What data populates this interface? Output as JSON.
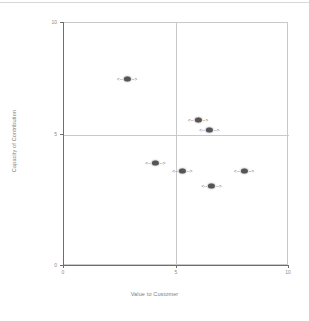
{
  "chart_data": {
    "type": "scatter",
    "title": "",
    "xlabel": "Value to Customer",
    "ylabel": "Capacity of Contribution",
    "xlim": [
      0,
      10
    ],
    "ylim": [
      0,
      10
    ],
    "xticks": [
      "0",
      "5",
      "10"
    ],
    "ytick_values": [
      0,
      5,
      10
    ],
    "yticks": [
      "0",
      "5",
      "10"
    ],
    "grid": false,
    "quadrant_lines": {
      "x": 5,
      "y": 5
    },
    "legend": "none",
    "points": [
      {
        "id": "p1",
        "label_left": "<--",
        "label_right": "-->",
        "name": "A",
        "x": 2.85,
        "y": 7.65
      },
      {
        "id": "p2",
        "label_left": "<--",
        "label_right": "-->",
        "name": "B",
        "x": 6.0,
        "y": 5.95
      },
      {
        "id": "p3",
        "label_left": "<--",
        "label_right": "-->",
        "name": "C",
        "x": 6.5,
        "y": 5.55
      },
      {
        "id": "p4",
        "label_left": "<--",
        "label_right": "-->",
        "name": "D",
        "x": 4.1,
        "y": 4.2
      },
      {
        "id": "p5",
        "label_left": "<--",
        "label_right": "-->",
        "name": "E",
        "x": 5.3,
        "y": 3.85
      },
      {
        "id": "p6",
        "label_left": "<--",
        "label_right": "-->",
        "name": "F",
        "x": 6.6,
        "y": 3.25
      },
      {
        "id": "p7",
        "label_left": "<--",
        "label_right": "-->",
        "name": "G",
        "x": 8.05,
        "y": 3.85
      }
    ]
  },
  "axis": {
    "x_tick_0": "0",
    "x_tick_1": "5",
    "x_tick_2": "10",
    "y_tick_0": "0",
    "y_tick_1": "5",
    "y_tick_2": "10",
    "x_title": "Value to Customer",
    "y_title": "Capacity of Contribution"
  }
}
